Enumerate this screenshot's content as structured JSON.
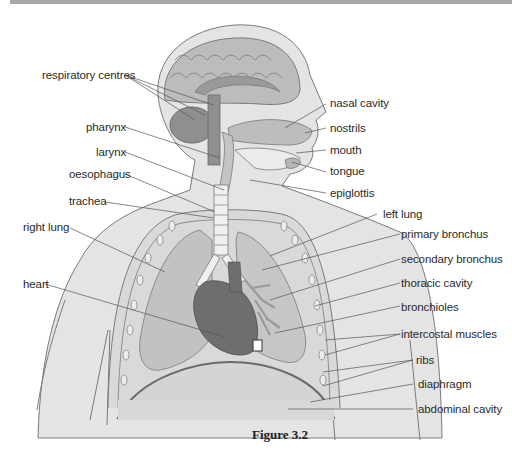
{
  "figure": {
    "caption": "Figure 3.2",
    "colors": {
      "background": "#ffffff",
      "skin": "#e2e2e2",
      "skin_outline": "#7a7a7a",
      "brain": "#b9b9b9",
      "brain_dark": "#8f8f8f",
      "lung": "#c4c4c4",
      "heart": "#6e6e6e",
      "airway": "#efefef",
      "abdomen": "#d6d6d6",
      "label_text": "#2a2a2a",
      "leader_line": "#555555",
      "top_bar": "#a8a8a8"
    }
  },
  "labels_left": [
    {
      "id": "respiratory-centres",
      "text": "respiratory centres"
    },
    {
      "id": "pharynx",
      "text": "pharynx"
    },
    {
      "id": "larynx",
      "text": "larynx"
    },
    {
      "id": "oesophagus",
      "text": "oesophagus"
    },
    {
      "id": "trachea",
      "text": "trachea"
    },
    {
      "id": "right-lung",
      "text": "right lung"
    },
    {
      "id": "heart",
      "text": "heart"
    }
  ],
  "labels_right": [
    {
      "id": "nasal-cavity",
      "text": "nasal cavity"
    },
    {
      "id": "nostrils",
      "text": "nostrils"
    },
    {
      "id": "mouth",
      "text": "mouth"
    },
    {
      "id": "tongue",
      "text": "tongue"
    },
    {
      "id": "epiglottis",
      "text": "epiglottis"
    },
    {
      "id": "left-lung",
      "text": "left lung"
    },
    {
      "id": "primary-bronchus",
      "text": "primary bronchus"
    },
    {
      "id": "secondary-bronchus",
      "text": "secondary bronchus"
    },
    {
      "id": "thoracic-cavity",
      "text": "thoracic cavity"
    },
    {
      "id": "bronchioles",
      "text": "bronchioles"
    },
    {
      "id": "intercostal-muscles",
      "text": "intercostal muscles"
    },
    {
      "id": "ribs",
      "text": "ribs"
    },
    {
      "id": "diaphragm",
      "text": "diaphragm"
    },
    {
      "id": "abdominal-cavity",
      "text": "abdominal cavity"
    }
  ]
}
